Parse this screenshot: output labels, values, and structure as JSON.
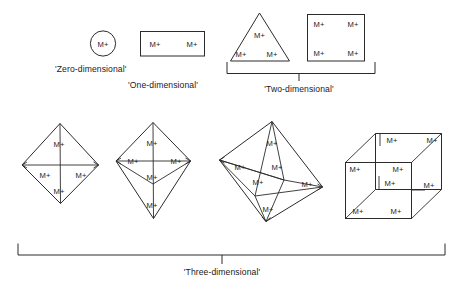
{
  "figure": {
    "node_label": "M+",
    "background_color": "#ffffff",
    "line_color": "#2b2b2b",
    "text_color": "#1a1a1a"
  },
  "captions": {
    "zero": "'Zero-dimensional'",
    "one": "'One-dimensional'",
    "two": "'Two-dimensional'",
    "three": "'Three-dimensional'"
  },
  "groups": [
    {
      "id": "zero-dimensional",
      "caption": "'Zero-dimensional'",
      "shapes": [
        {
          "id": "circle",
          "name": "circle-single-site",
          "label_count": 1,
          "labels": [
            "M+"
          ]
        }
      ]
    },
    {
      "id": "one-dimensional",
      "caption": "'One-dimensional'",
      "shapes": [
        {
          "id": "rectangle",
          "name": "rectangle-two-sites",
          "label_count": 2,
          "labels": [
            "M+",
            "M+"
          ]
        }
      ]
    },
    {
      "id": "two-dimensional",
      "caption": "'Two-dimensional'",
      "shapes": [
        {
          "id": "triangle",
          "name": "triangle-three-sites",
          "label_count": 3,
          "labels": [
            "M+",
            "M+",
            "M+"
          ]
        },
        {
          "id": "square",
          "name": "square-four-sites",
          "label_count": 4,
          "labels": [
            "M+",
            "M+",
            "M+",
            "M+"
          ]
        }
      ]
    },
    {
      "id": "three-dimensional",
      "caption": "'Three-dimensional'",
      "shapes": [
        {
          "id": "tetrahedron",
          "name": "tetrahedron-four-sites",
          "label_count": 4,
          "labels": [
            "M+",
            "M+",
            "M+",
            "M+"
          ]
        },
        {
          "id": "trigonal-bipyramid",
          "name": "trigonal-bipyramid-five-sites",
          "label_count": 5,
          "labels": [
            "M+",
            "M+",
            "M+",
            "M+",
            "M+"
          ]
        },
        {
          "id": "octahedron",
          "name": "octahedron-six-sites",
          "label_count": 6,
          "labels": [
            "M+",
            "M+",
            "M+",
            "M+",
            "M+",
            "M+"
          ]
        },
        {
          "id": "cube",
          "name": "cube-eight-sites",
          "label_count": 8,
          "labels": [
            "M+",
            "M+",
            "M+",
            "M+",
            "M+",
            "M+",
            "M+",
            "M+"
          ]
        }
      ]
    }
  ],
  "labels": {
    "circle": [
      "M+"
    ],
    "rectangle": [
      "M+",
      "M+"
    ],
    "triangle": [
      "M+",
      "M+",
      "M+"
    ],
    "square": [
      "M+",
      "M+",
      "M+",
      "M+"
    ],
    "tetrahedron": [
      "M+",
      "M+",
      "M+",
      "M+"
    ],
    "bipyramid": [
      "M+",
      "M+",
      "M+",
      "M+",
      "M+"
    ],
    "octahedron": [
      "M+",
      "M+",
      "M+",
      "M+",
      "M+",
      "M+"
    ],
    "cube": [
      "M+",
      "M+",
      "M+",
      "M+",
      "M+",
      "M+",
      "M+",
      "M+"
    ]
  }
}
